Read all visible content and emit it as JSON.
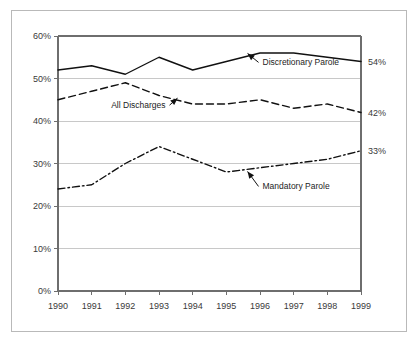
{
  "chart_data": {
    "type": "line",
    "title": "",
    "subtitle": "",
    "xlabel": "",
    "ylabel": "",
    "x": [
      1990,
      1991,
      1992,
      1993,
      1994,
      1995,
      1996,
      1997,
      1998,
      1999
    ],
    "categories": [
      "1990",
      "1991",
      "1992",
      "1993",
      "1994",
      "1995",
      "1996",
      "1997",
      "1998",
      "1999"
    ],
    "ylim": [
      0,
      60
    ],
    "yticks": [
      0,
      10,
      20,
      30,
      40,
      50,
      60
    ],
    "ytick_labels": [
      "0%",
      "10%",
      "20%",
      "30%",
      "40%",
      "50%",
      "60%"
    ],
    "grid": true,
    "grid_axis": "y",
    "legend_position": "inline-annotations",
    "series": [
      {
        "name": "Discretionary Parole",
        "style": "solid",
        "values": [
          52,
          53,
          51,
          55,
          52,
          54,
          56,
          56,
          55,
          54
        ],
        "end_label": "54%"
      },
      {
        "name": "All Discharges",
        "style": "dashed",
        "values": [
          45,
          47,
          49,
          46,
          44,
          44,
          45,
          43,
          44,
          42
        ],
        "end_label": "42%"
      },
      {
        "name": "Mandatory Parole",
        "style": "dash-dot",
        "values": [
          24,
          25,
          30,
          34,
          31,
          28,
          29,
          30,
          31,
          33
        ],
        "end_label": "33%"
      }
    ],
    "annotations": [
      {
        "text": "Discretionary Parole",
        "series": "Discretionary Parole"
      },
      {
        "text": "All Discharges",
        "series": "All Discharges"
      },
      {
        "text": "Mandatory Parole",
        "series": "Mandatory Parole"
      }
    ],
    "colors": {
      "line": "#111111",
      "grid": "#c8c8c8",
      "axis": "#6e6e6e",
      "text": "#3a3a3a",
      "background": "#ffffff",
      "frame": "#b9b9b9"
    }
  }
}
